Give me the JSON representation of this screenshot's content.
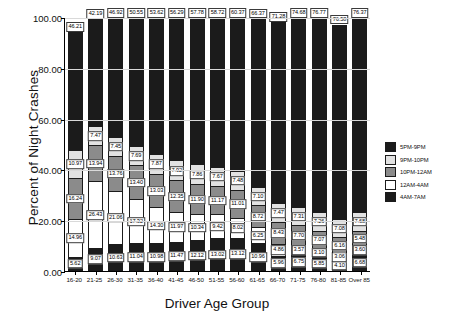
{
  "chart_data": {
    "type": "bar",
    "stacked": true,
    "title": "",
    "xlabel": "Driver Age Group",
    "ylabel": "Percent of Night Crashes",
    "ylim": [
      0,
      100
    ],
    "yticks": [
      "0.00",
      "20.00",
      "40.00",
      "60.00",
      "80.00",
      "100.00"
    ],
    "ytick_values": [
      0,
      20,
      40,
      60,
      80,
      100
    ],
    "grid": true,
    "legend_position": "right",
    "categories": [
      "16-20",
      "21-25",
      "26-30",
      "31-35",
      "36-40",
      "41-45",
      "46-50",
      "51-55",
      "56-60",
      "61-65",
      "66-70",
      "71-75",
      "76-80",
      "81-85",
      "Over 85"
    ],
    "series": [
      {
        "name": "4AM-7AM",
        "color": "#1b1b1b",
        "values": [
          5.62,
          9.07,
          10.63,
          11.04,
          10.98,
          11.47,
          12.12,
          13.02,
          13.12,
          10.96,
          5.96,
          6.75,
          5.85,
          4.1,
          6.68
        ]
      },
      {
        "name": "12AM-4AM",
        "color": "#ffffff",
        "values": [
          14.96,
          26.43,
          21.06,
          17.32,
          14.3,
          11.97,
          10.34,
          9.42,
          8.02,
          6.25,
          4.86,
          3.57,
          3.1,
          3.06,
          3.6
        ]
      },
      {
        "name": "10PM-12AM",
        "color": "#8b8b8b",
        "values": [
          16.24,
          13.94,
          13.76,
          13.4,
          13.03,
          12.35,
          11.9,
          11.17,
          11.01,
          8.72,
          8.43,
          7.7,
          7.07,
          6.16,
          5.48
        ]
      },
      {
        "name": "9PM-10PM",
        "color": "#e2e2e2",
        "values": [
          10.97,
          7.47,
          7.45,
          7.69,
          7.87,
          7.92,
          7.86,
          7.67,
          7.48,
          7.1,
          7.47,
          7.31,
          7.26,
          7.08,
          7.68
        ]
      },
      {
        "name": "5PM-9PM",
        "color": "#1b1b1b",
        "values": [
          46.21,
          42.19,
          46.92,
          50.55,
          53.62,
          56.29,
          57.78,
          58.72,
          60.37,
          66.37,
          71.28,
          74.68,
          76.77,
          76.58,
          76.37
        ]
      }
    ],
    "legend": [
      {
        "label": "5PM-9PM",
        "color": "#1b1b1b"
      },
      {
        "label": "9PM-10PM",
        "color": "#e2e2e2"
      },
      {
        "label": "10PM-12AM",
        "color": "#8b8b8b"
      },
      {
        "label": "12AM-4AM",
        "color": "#ffffff"
      },
      {
        "label": "4AM-7AM",
        "color": "#1b1b1b"
      }
    ]
  }
}
